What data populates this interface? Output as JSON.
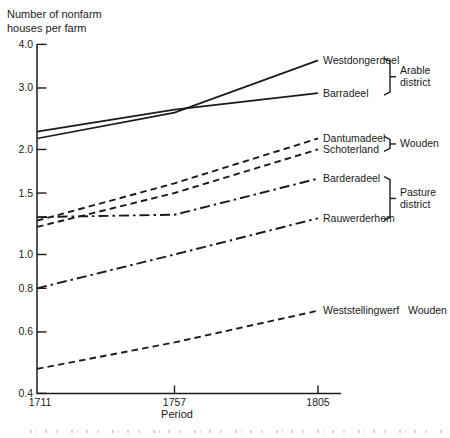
{
  "figure_title": {
    "line1": "Number of nonfarm",
    "line2": "houses per farm"
  },
  "colors": {
    "ink": "#1b1b1b",
    "background": "#ffffff"
  },
  "chart_data": {
    "type": "line",
    "title": "Number of nonfarm houses per farm",
    "xlabel": "Period",
    "ylabel": "Number of nonfarm houses per farm",
    "x_scale": "linear",
    "y_scale": "log",
    "x": [
      1711,
      1757,
      1805
    ],
    "x_tick_labels": [
      "1711",
      "1757",
      "1805"
    ],
    "y_tick_labels": [
      "4.0",
      "3.0",
      "2.0",
      "1.5",
      "1.0",
      "0.8",
      "0.6",
      "0.4"
    ],
    "ylim": [
      0.4,
      4.0
    ],
    "grid": false,
    "legend_position": "labels-at-line-ends",
    "series": [
      {
        "name": "Westdongerdeel",
        "style": "solid",
        "group": "Arable district",
        "values": [
          2.15,
          2.55,
          3.6
        ]
      },
      {
        "name": "Barradeel",
        "style": "solid",
        "group": "Arable district",
        "values": [
          2.25,
          2.6,
          2.9
        ]
      },
      {
        "name": "Dantumadeel",
        "style": "dashed",
        "group": "Wouden",
        "values": [
          1.25,
          1.6,
          2.15
        ]
      },
      {
        "name": "Schoterland",
        "style": "dashed",
        "group": "Wouden",
        "values": [
          1.2,
          1.5,
          2.0
        ]
      },
      {
        "name": "Barderadeel",
        "style": "dashdot",
        "group": "Pasture district",
        "values": [
          1.28,
          1.3,
          1.65
        ]
      },
      {
        "name": "Rauwerderhem",
        "style": "dashdot",
        "group": "Pasture district",
        "values": [
          0.8,
          1.0,
          1.27
        ]
      },
      {
        "name": "Weststellingwerf",
        "style": "dashed",
        "group": "Wouden",
        "inline_group_label": "Wouden",
        "values": [
          0.47,
          0.56,
          0.69
        ]
      }
    ],
    "group_brackets": [
      {
        "label": "Arable district",
        "from": "Westdongerdeel",
        "to": "Barradeel"
      },
      {
        "label": "Wouden",
        "from": "Dantumadeel",
        "to": "Schoterland"
      },
      {
        "label": "Pasture district",
        "from": "Barderadeel",
        "to": "Rauwerderhem"
      }
    ]
  }
}
